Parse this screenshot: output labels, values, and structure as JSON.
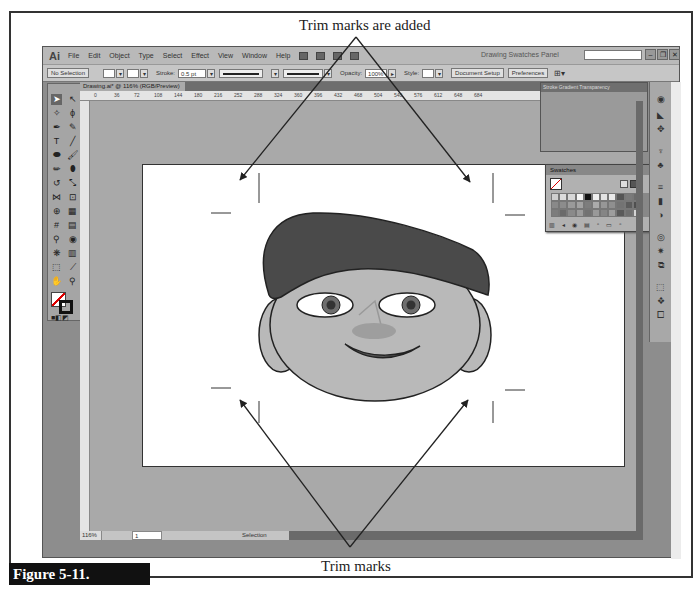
{
  "callouts": {
    "top": "Trim marks are added",
    "bottom": "Trim marks"
  },
  "figure": {
    "label": "Figure 5-11."
  },
  "app": {
    "logo": "Ai",
    "menu": [
      "File",
      "Edit",
      "Object",
      "Type",
      "Select",
      "Effect",
      "View",
      "Window",
      "Help"
    ],
    "workspace": "Drawing Swatches Panel",
    "search_placeholder": "",
    "window_buttons": [
      "–",
      "❐",
      "✕"
    ],
    "control_bar": {
      "selection": "No Selection",
      "stroke_label": "Stroke:",
      "stroke_value": "0.5 pt",
      "profile": "Uniform",
      "opacity_label": "Opacity:",
      "opacity_value": "100%",
      "style_label": "Style:",
      "document_setup": "Document Setup",
      "preferences": "Preferences"
    },
    "document_tab": "Drawing.ai* @ 116% (RGB/Preview)",
    "ruler_ticks": [
      "0",
      "36",
      "72",
      "108",
      "144",
      "180",
      "216",
      "252",
      "288",
      "324",
      "360",
      "396",
      "432",
      "468",
      "504",
      "540",
      "576",
      "612",
      "648",
      "684"
    ],
    "status": {
      "zoom": "116%",
      "page": "1",
      "mode": "Selection"
    },
    "panel_group_tabs": "Stroke  Gradient  Transparency",
    "swatches": {
      "title": "Swatches",
      "colors": [
        "#cfcfcf",
        "#dcdcdc",
        "#d8d8d8",
        "#f6f6f6",
        "#111111",
        "#eeeeee",
        "#e3e3e3",
        "#e9e9e9",
        "#555555",
        "#7a7a7a",
        "#6b6b6b",
        "#898989",
        "#8c8c8c",
        "#9a9a9a",
        "#a2a2a2",
        "#7d7d7d",
        "#aaaaaa",
        "#979797",
        "#8f8f8f",
        "#737373",
        "#5c5c5c",
        "#4f4f4f",
        "#7c7c7c",
        "#6a6a6a",
        "#8a8a8a",
        "#9b9b9b",
        "#727272",
        "#999999",
        "#858585",
        "#9e9e9e",
        "#5a5a5a",
        "#6f6f6f",
        "#d4d4d4"
      ]
    }
  },
  "illustration": {
    "hat_color": "#4a4a4a",
    "face_color": "#b9b9b9",
    "outline_color": "#222222"
  }
}
